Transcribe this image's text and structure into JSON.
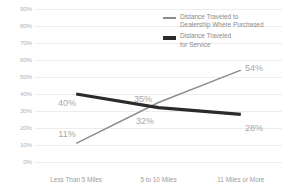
{
  "chart_data": {
    "type": "line",
    "title": "",
    "xlabel": "",
    "ylabel": "",
    "categories": [
      "Less Than 5 Miles",
      "5 to 10 Miles",
      "11 Miles or More"
    ],
    "ylim": [
      0,
      90
    ],
    "ytick_labels": [
      "90%",
      "80%",
      "70%",
      "60%",
      "50%",
      "40%",
      "30%",
      "20%",
      "10%",
      "0%"
    ],
    "ytick_values": [
      90,
      80,
      70,
      60,
      50,
      40,
      30,
      20,
      10,
      0
    ],
    "grid": true,
    "legend_position": "top-right",
    "series": [
      {
        "name": "Distance Traveled to\nDealership Where Purchased",
        "values": [
          11,
          35,
          54
        ],
        "point_labels": [
          "11%",
          "35%",
          "54%"
        ],
        "color": "#8c8c8c",
        "width": "thin"
      },
      {
        "name": "Distance Traveled\nfor Service",
        "values": [
          40,
          32,
          28
        ],
        "point_labels": [
          "40%",
          "32%",
          "28%"
        ],
        "color": "#2b2b2b",
        "width": "thick"
      }
    ],
    "annotations": [
      {
        "text": "40%",
        "x": 67,
        "y": 103
      },
      {
        "text": "11%",
        "x": 67,
        "y": 134
      },
      {
        "text": "35%",
        "x": 143,
        "y": 99
      },
      {
        "text": "32%",
        "x": 145,
        "y": 121
      },
      {
        "text": "54%",
        "x": 254,
        "y": 68
      },
      {
        "text": "28%",
        "x": 254,
        "y": 128
      }
    ],
    "colors": {
      "background": "#ffffff",
      "gridline": "#ededed",
      "axis_text": "#b3b3b3",
      "label_text": "#a8a8a8",
      "legend_text": "#8a8a8a",
      "series_purchased": "#8c8c8c",
      "series_service": "#2b2b2b"
    }
  }
}
